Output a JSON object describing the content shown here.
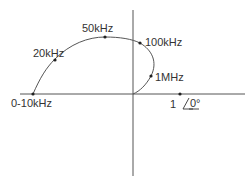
{
  "diagram": {
    "title": "",
    "type": "polar-frequency-locus",
    "axes": {
      "real_axis": "horizontal",
      "imag_axis": "vertical"
    },
    "reference_label": {
      "magnitude": "1",
      "angle": "0°"
    },
    "points": [
      {
        "label": "0-10kHz"
      },
      {
        "label": "20kHz"
      },
      {
        "label": "50kHz"
      },
      {
        "label": "100kHz"
      },
      {
        "label": "1MHz"
      }
    ],
    "colors": {
      "line": "#555555",
      "text": "#333333",
      "background": "#ffffff"
    }
  }
}
